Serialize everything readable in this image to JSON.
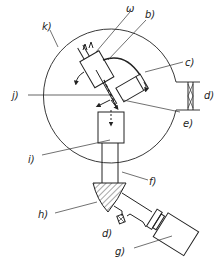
{
  "diagram": {
    "type": "schematic",
    "labels": {
      "w": "ω",
      "b": "b)",
      "c": "c)",
      "d_right": "d)",
      "e": "e)",
      "j": "j)",
      "k": "k)",
      "i": "i)",
      "f": "f)",
      "h": "h)",
      "d_bottom": "d)",
      "g": "g)"
    },
    "colors": {
      "ink": "#222222",
      "background": "#ffffff"
    }
  }
}
